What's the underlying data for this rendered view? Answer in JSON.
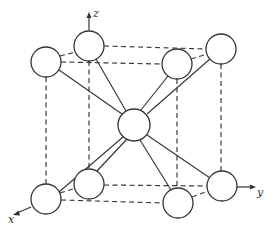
{
  "figure": {
    "axes": {
      "x": {
        "label": "x"
      },
      "y": {
        "label": "y"
      },
      "z": {
        "label": "z"
      }
    },
    "atoms": [
      {
        "id": "top-front-left",
        "cx": 46,
        "cy": 62,
        "r": 15
      },
      {
        "id": "top-back-left",
        "cx": 89,
        "cy": 46,
        "r": 15
      },
      {
        "id": "top-front-right",
        "cx": 177,
        "cy": 64,
        "r": 15
      },
      {
        "id": "top-back-right",
        "cx": 221,
        "cy": 49,
        "r": 15
      },
      {
        "id": "center",
        "cx": 134,
        "cy": 125,
        "r": 16
      },
      {
        "id": "bottom-front-left",
        "cx": 46,
        "cy": 199,
        "r": 15
      },
      {
        "id": "bottom-back-left",
        "cx": 89,
        "cy": 184,
        "r": 15
      },
      {
        "id": "bottom-front-right",
        "cx": 178,
        "cy": 203,
        "r": 15
      },
      {
        "id": "bottom-back-right",
        "cx": 222,
        "cy": 186,
        "r": 15
      }
    ]
  }
}
